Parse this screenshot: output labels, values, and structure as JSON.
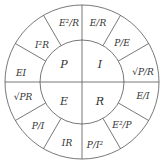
{
  "diagram": {
    "colors": {
      "line": "#555555",
      "text": "#333333",
      "background": "#ffffff"
    },
    "inner": [
      {
        "quantity": "P",
        "label": "P"
      },
      {
        "quantity": "I",
        "label": "I"
      },
      {
        "quantity": "R",
        "label": "R"
      },
      {
        "quantity": "E",
        "label": "E"
      }
    ],
    "outer": [
      {
        "label": "E²/R"
      },
      {
        "label": "E/R"
      },
      {
        "label": "P/E"
      },
      {
        "label": "√P/R"
      },
      {
        "label": "E/I"
      },
      {
        "label": "E²/P"
      },
      {
        "label": "P/I²"
      },
      {
        "label": "IR"
      },
      {
        "label": "P/I"
      },
      {
        "label": "√PR"
      },
      {
        "label": "EI"
      },
      {
        "label": "I²R"
      }
    ]
  }
}
